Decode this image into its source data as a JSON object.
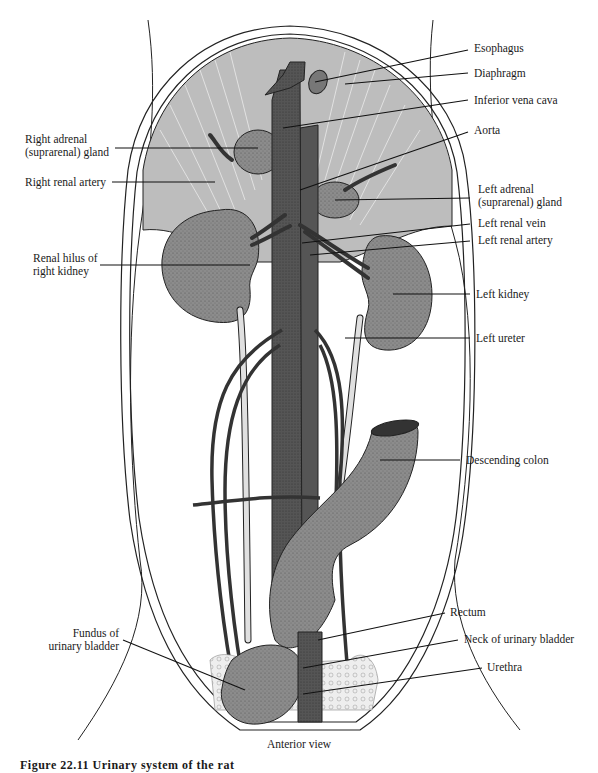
{
  "figure": {
    "view_label": "Anterior view",
    "caption_partial": "Figure 22.11  Urinary system of the rat",
    "colors": {
      "background": "#ffffff",
      "diaphragm": "#b9b9b9",
      "organ_fill": "#8a8a8a",
      "vessel_dark": "#4a4a4a",
      "ureter": "#d6d6d6",
      "outline": "#1a1a1a"
    }
  },
  "labels": {
    "right": [
      {
        "id": "esophagus",
        "text": "Esophagus"
      },
      {
        "id": "diaphragm",
        "text": "Diaphragm"
      },
      {
        "id": "inferior-vena-cava",
        "text": "Inferior vena cava"
      },
      {
        "id": "aorta",
        "text": "Aorta"
      },
      {
        "id": "left-adrenal-gland",
        "line1": "Left adrenal",
        "line2": "(suprarenal) gland"
      },
      {
        "id": "left-renal-vein",
        "text": "Left renal vein"
      },
      {
        "id": "left-renal-artery",
        "text": "Left renal artery"
      },
      {
        "id": "left-kidney",
        "text": "Left kidney"
      },
      {
        "id": "left-ureter",
        "text": "Left ureter"
      },
      {
        "id": "descending-colon",
        "text": "Descending colon"
      },
      {
        "id": "rectum",
        "text": "Rectum"
      },
      {
        "id": "neck-of-urinary-bladder",
        "text": "Neck of urinary bladder"
      },
      {
        "id": "urethra",
        "text": "Urethra"
      }
    ],
    "left": [
      {
        "id": "right-adrenal-gland",
        "line1": "Right adrenal",
        "line2": "(suprarenal) gland"
      },
      {
        "id": "right-renal-artery",
        "text": "Right renal artery"
      },
      {
        "id": "renal-hilus-right-kidney",
        "line1": "Renal hilus of",
        "line2": "right kidney"
      },
      {
        "id": "fundus-urinary-bladder",
        "line1": "Fundus of",
        "line2": "urinary bladder"
      }
    ]
  }
}
